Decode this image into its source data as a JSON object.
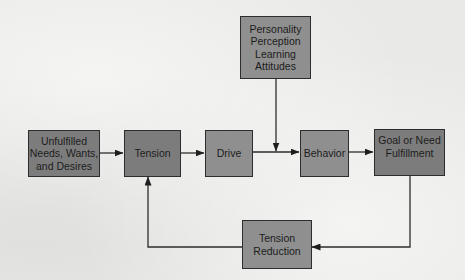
{
  "diagram": {
    "type": "flowchart",
    "boxes": {
      "unfulfilled": "Unfulfilled\nNeeds, Wants,\nand Desires",
      "tension": "Tension",
      "drive": "Drive",
      "behavior": "Behavior",
      "goal": "Goal or Need\nFulfillment",
      "influences": "Personality\nPerception\nLearning\nAttitudes",
      "tension_reduction": "Tension\nReduction"
    },
    "edges": [
      {
        "from": "unfulfilled",
        "to": "tension"
      },
      {
        "from": "tension",
        "to": "drive"
      },
      {
        "from": "drive",
        "to": "behavior"
      },
      {
        "from": "influences",
        "to": "drive-behavior-link"
      },
      {
        "from": "behavior",
        "to": "goal"
      },
      {
        "from": "goal",
        "to": "tension_reduction"
      },
      {
        "from": "tension_reduction",
        "to": "tension"
      }
    ],
    "colors": {
      "box_dark": "#7c7c7c",
      "box_mid": "#8f8f8f",
      "line": "#2d2d2d",
      "background": "#e9e9e7"
    }
  }
}
